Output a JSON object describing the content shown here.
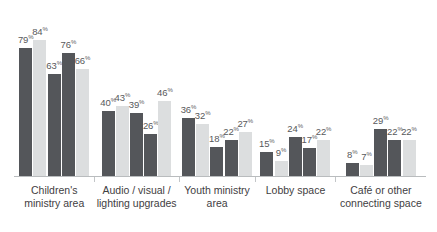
{
  "chart_data": {
    "type": "bar",
    "title": "",
    "subtitle": "",
    "xlabel": "",
    "ylabel": "",
    "ylim": [
      0,
      100
    ],
    "grid": false,
    "legend": "none",
    "value_suffix": "%",
    "categories": [
      "Children's ministry area",
      "Audio / visual / lighting upgrades",
      "Youth ministry area",
      "Lobby space",
      "Café or other connecting space"
    ],
    "series": [
      {
        "name": "Series 1",
        "color": "#54565a",
        "values": [
          79,
          40,
          36,
          15,
          8
        ]
      },
      {
        "name": "Series 2",
        "color": "#dcdedf",
        "values": [
          84,
          43,
          32,
          9,
          7
        ]
      },
      {
        "name": "Series 3",
        "color": "#54565a",
        "values": [
          63,
          39,
          18,
          24,
          29
        ]
      },
      {
        "name": "Series 4",
        "color": "#54565a",
        "values": [
          76,
          26,
          22,
          17,
          22
        ]
      },
      {
        "name": "Series 5",
        "color": "#dcdedf",
        "values": [
          66,
          46,
          27,
          22,
          22
        ]
      }
    ],
    "groups": [
      {
        "category": "Children's ministry area",
        "bars": [
          {
            "value": 79,
            "label": "79",
            "suffix": "%",
            "shade": "dark"
          },
          {
            "value": 84,
            "label": "84",
            "suffix": "%",
            "shade": "light"
          },
          {
            "value": 63,
            "label": "63",
            "suffix": "%",
            "shade": "dark"
          },
          {
            "value": 76,
            "label": "76",
            "suffix": "%",
            "shade": "dark"
          },
          {
            "value": 66,
            "label": "66",
            "suffix": "%",
            "shade": "light"
          }
        ]
      },
      {
        "category": "Audio / visual / lighting upgrades",
        "bars": [
          {
            "value": 40,
            "label": "40",
            "suffix": "%",
            "shade": "dark"
          },
          {
            "value": 43,
            "label": "43",
            "suffix": "%",
            "shade": "light"
          },
          {
            "value": 39,
            "label": "39",
            "suffix": "%",
            "shade": "dark"
          },
          {
            "value": 26,
            "label": "26",
            "suffix": "%",
            "shade": "dark"
          },
          {
            "value": 46,
            "label": "46",
            "suffix": "%",
            "shade": "light"
          }
        ]
      },
      {
        "category": "Youth ministry area",
        "bars": [
          {
            "value": 36,
            "label": "36",
            "suffix": "%",
            "shade": "dark"
          },
          {
            "value": 32,
            "label": "32",
            "suffix": "%",
            "shade": "light"
          },
          {
            "value": 18,
            "label": "18",
            "suffix": "%",
            "shade": "dark"
          },
          {
            "value": 22,
            "label": "22",
            "suffix": "%",
            "shade": "dark"
          },
          {
            "value": 27,
            "label": "27",
            "suffix": "%",
            "shade": "light"
          }
        ]
      },
      {
        "category": "Lobby space",
        "bars": [
          {
            "value": 15,
            "label": "15",
            "suffix": "%",
            "shade": "dark"
          },
          {
            "value": 9,
            "label": "9",
            "suffix": "%",
            "shade": "light"
          },
          {
            "value": 24,
            "label": "24",
            "suffix": "%",
            "shade": "dark"
          },
          {
            "value": 17,
            "label": "17",
            "suffix": "%",
            "shade": "dark"
          },
          {
            "value": 22,
            "label": "22",
            "suffix": "%",
            "shade": "light"
          }
        ]
      },
      {
        "category": "Café or other connecting space",
        "bars": [
          {
            "value": 8,
            "label": "8",
            "suffix": "%",
            "shade": "dark"
          },
          {
            "value": 7,
            "label": "7",
            "suffix": "%",
            "shade": "light"
          },
          {
            "value": 29,
            "label": "29",
            "suffix": "%",
            "shade": "dark"
          },
          {
            "value": 22,
            "label": "22",
            "suffix": "%",
            "shade": "dark"
          },
          {
            "value": 22,
            "label": "22",
            "suffix": "%",
            "shade": "light"
          }
        ]
      }
    ],
    "colors": {
      "dark": "#54565a",
      "light": "#dcdedf",
      "axis": "#b9bcbe",
      "label_text": "#58595b",
      "category_text": "#3f4042",
      "background": "#ffffff"
    }
  }
}
